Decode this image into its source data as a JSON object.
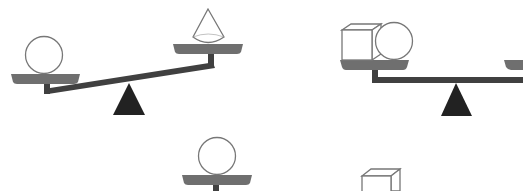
{
  "colors": {
    "pan": "#6f6f6f",
    "beam": "#404040",
    "fulcrum": "#222222",
    "outline": "#777777",
    "background": "#ffffff"
  },
  "scales": [
    {
      "id": "scale-1",
      "state": "tilted-left-down",
      "left_pan": [
        "sphere"
      ],
      "right_pan": [
        "cone"
      ]
    },
    {
      "id": "scale-2",
      "state": "level",
      "left_pan": [
        "cube",
        "sphere"
      ],
      "right_pan": [
        "(cropped)"
      ]
    },
    {
      "id": "scale-3",
      "state": "partial",
      "pan": [
        "sphere"
      ]
    },
    {
      "id": "scale-4",
      "state": "partial",
      "pan": [
        "cube"
      ]
    }
  ]
}
